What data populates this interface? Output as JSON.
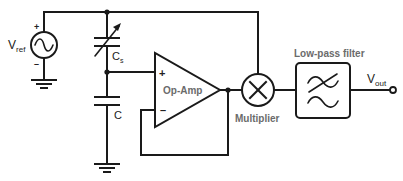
{
  "diagram": {
    "type": "circuit-schematic",
    "colors": {
      "wire": "#1a1a1a",
      "label": "#222222",
      "block_label": "#6b6b6b",
      "background": "#ffffff"
    },
    "components": {
      "source": {
        "label_main": "V",
        "label_sub": "ref",
        "plus": "+",
        "minus": "–",
        "icon": "ac-voltage-source-icon"
      },
      "variable_capacitor": {
        "label_main": "C",
        "label_sub": "s",
        "icon": "variable-capacitor-icon"
      },
      "capacitor": {
        "label": "C",
        "icon": "capacitor-icon"
      },
      "opamp": {
        "label": "Op-Amp",
        "plus": "+",
        "minus": "–",
        "icon": "op-amp-icon"
      },
      "multiplier": {
        "label": "Multiplier",
        "icon": "multiplier-icon"
      },
      "lowpass": {
        "label": "Low-pass filter",
        "icon": "low-pass-filter-icon"
      },
      "output": {
        "label_main": "V",
        "label_sub": "out",
        "icon": "output-terminal-icon"
      },
      "grounds": [
        "ground-icon",
        "ground-icon"
      ]
    }
  }
}
